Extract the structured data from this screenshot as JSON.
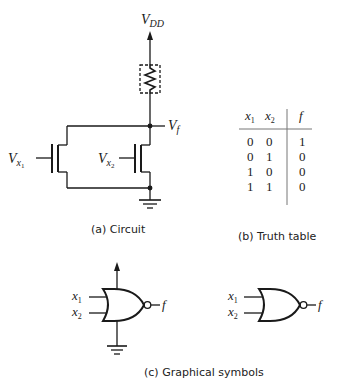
{
  "circuit": {
    "supply_label": "V",
    "supply_sub": "DD",
    "output_label": "V",
    "output_sub": "f",
    "input1_label": "V",
    "input1_sub": "x",
    "input1_subsub": "1",
    "input2_label": "V",
    "input2_sub": "x",
    "input2_subsub": "2",
    "caption": "(a) Circuit"
  },
  "truth_table": {
    "headers": [
      {
        "var": "x",
        "sub": "1"
      },
      {
        "var": "x",
        "sub": "2"
      },
      {
        "var": "f",
        "sub": ""
      }
    ],
    "rows": [
      [
        "0",
        "0",
        "1"
      ],
      [
        "0",
        "1",
        "0"
      ],
      [
        "1",
        "0",
        "0"
      ],
      [
        "1",
        "1",
        "0"
      ]
    ],
    "caption": "(b) Truth table"
  },
  "symbols": {
    "gate1": {
      "in1": "x",
      "in1_sub": "1",
      "in2": "x",
      "in2_sub": "2",
      "out": "f"
    },
    "gate2": {
      "in1": "x",
      "in1_sub": "1",
      "in2": "x",
      "in2_sub": "2",
      "out": "f"
    },
    "caption": "(c) Graphical symbols"
  }
}
